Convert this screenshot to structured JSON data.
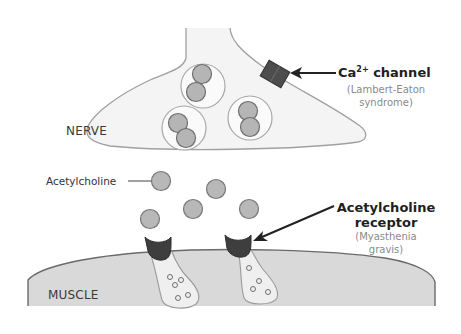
{
  "diagram": {
    "regions": {
      "nerve": "NERVE",
      "muscle": "MUSCLE"
    },
    "labels": {
      "acetylcholine": "Acetylcholine",
      "ca_channel": {
        "name": "Ca",
        "superscript": "2+",
        "suffix": " channel",
        "disease_line1": "(Lambert-Eaton",
        "disease_line2": "syndrome)"
      },
      "ach_receptor": {
        "line1": "Acetylcholine",
        "line2": "receptor",
        "disease_line1": "(Myasthenia",
        "disease_line2": "gravis)"
      }
    },
    "colors": {
      "nerve_fill": "#f3f3f3",
      "outline": "#9a9a9a",
      "vesicle_fill": "#b5b5b5",
      "vesicle_stroke": "#6e6e6e",
      "receptor_fill": "#3e3e3e",
      "muscle_fill": "#d9d9d9",
      "muscle_stroke": "#6a6a6a",
      "channel_fill": "#4d4d4d",
      "arrow": "#222222"
    }
  }
}
